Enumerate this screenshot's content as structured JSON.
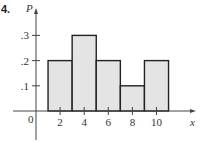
{
  "problem_number": "4.",
  "chart_data": {
    "type": "bar",
    "title": "",
    "xlabel": "x",
    "ylabel": "P",
    "categories": [
      "2",
      "4",
      "6",
      "8",
      "10"
    ],
    "bins": [
      {
        "x_start": 1,
        "x_end": 3,
        "value": 0.2
      },
      {
        "x_start": 3,
        "x_end": 5,
        "value": 0.3
      },
      {
        "x_start": 5,
        "x_end": 7,
        "value": 0.2
      },
      {
        "x_start": 7,
        "x_end": 9,
        "value": 0.1
      },
      {
        "x_start": 9,
        "x_end": 11,
        "value": 0.2
      }
    ],
    "values": [
      0.2,
      0.3,
      0.2,
      0.1,
      0.2
    ],
    "x_ticks": [
      2,
      4,
      6,
      8,
      10
    ],
    "x_tick_labels": [
      "2",
      "4",
      "6",
      "8",
      "10"
    ],
    "y_ticks": [
      0.1,
      0.2,
      0.3
    ],
    "y_tick_labels": [
      ".1",
      ".2",
      ".3"
    ],
    "origin_label": "0",
    "ylim": [
      0,
      0.4
    ],
    "xlim": [
      -2,
      13
    ],
    "grid": false,
    "legend": null,
    "bar_fill": "#e4e4e4",
    "bar_stroke": "#222222"
  }
}
